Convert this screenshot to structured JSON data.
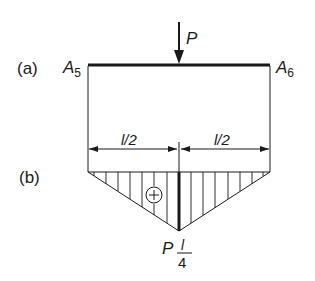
{
  "diagram": {
    "part_a": {
      "label": "(a)",
      "left_support": {
        "name": "A",
        "subscript": "5"
      },
      "right_support": {
        "name": "A",
        "subscript": "6"
      },
      "load": {
        "label": "P",
        "position": "midspan",
        "direction": "down"
      }
    },
    "part_b": {
      "label": "(b)",
      "dimension_left": "l/2",
      "dimension_right": "l/2",
      "sign": "+",
      "peak_value": {
        "prefix": "P",
        "numerator": "l",
        "denominator": "4"
      }
    }
  },
  "colors": {
    "line": "#1a1a1a",
    "background": "#ffffff"
  }
}
